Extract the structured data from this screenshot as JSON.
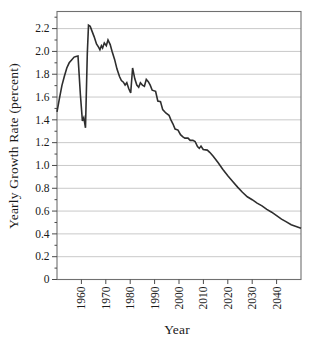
{
  "figure": {
    "background": "#ffffff",
    "frame_color": "#707070",
    "grid_color": "#c9c9c9",
    "tick_color": "#4a4a4a",
    "line_color": "#2e2e2e",
    "text_color": "#1a1a1a"
  },
  "chart_data": {
    "type": "line",
    "title": "",
    "xlabel": "Year",
    "ylabel": "Yearly Growth Rate (percent)",
    "xlim": [
      1950,
      2050
    ],
    "ylim": [
      0,
      2.35
    ],
    "grid": "horizontal-major",
    "legend": "none",
    "x_ticks": [
      1960,
      1970,
      1980,
      1990,
      2000,
      2010,
      2020,
      2030,
      2040
    ],
    "y_ticks": [
      {
        "value": 0.0,
        "label": "0"
      },
      {
        "value": 0.2,
        "label": "0.2"
      },
      {
        "value": 0.4,
        "label": "0.4"
      },
      {
        "value": 0.6,
        "label": "0.6"
      },
      {
        "value": 0.8,
        "label": "0.8"
      },
      {
        "value": 1.0,
        "label": "1.0"
      },
      {
        "value": 1.2,
        "label": "1.2"
      },
      {
        "value": 1.4,
        "label": "1.4"
      },
      {
        "value": 1.6,
        "label": "1.6"
      },
      {
        "value": 1.8,
        "label": "1.8"
      },
      {
        "value": 2.0,
        "label": "2.0"
      },
      {
        "value": 2.2,
        "label": "2.2"
      }
    ],
    "y_minor_ticks": [
      0.1,
      0.3,
      0.5,
      0.7,
      0.9,
      1.1,
      1.3,
      1.5,
      1.7,
      1.9,
      2.1,
      2.3
    ],
    "series": [
      {
        "name": "World yearly population growth rate (observed and projected)",
        "points": [
          [
            1950,
            1.47
          ],
          [
            1951,
            1.585
          ],
          [
            1952,
            1.7
          ],
          [
            1953,
            1.78
          ],
          [
            1954,
            1.855
          ],
          [
            1955,
            1.9
          ],
          [
            1956,
            1.925
          ],
          [
            1957,
            1.95
          ],
          [
            1957.8,
            1.955
          ],
          [
            1958.6,
            1.96
          ],
          [
            1959.6,
            1.62
          ],
          [
            1960.4,
            1.39
          ],
          [
            1961,
            1.42
          ],
          [
            1961.7,
            1.33
          ],
          [
            1962.4,
            1.98
          ],
          [
            1962.9,
            2.23
          ],
          [
            1963.6,
            2.22
          ],
          [
            1964.3,
            2.18
          ],
          [
            1965.2,
            2.13
          ],
          [
            1966.2,
            2.065
          ],
          [
            1967.1,
            2.035
          ],
          [
            1967.6,
            2.015
          ],
          [
            1968.2,
            2.05
          ],
          [
            1968.7,
            2.03
          ],
          [
            1969.4,
            2.075
          ],
          [
            1970.2,
            2.05
          ],
          [
            1970.9,
            2.1
          ],
          [
            1971.8,
            2.06
          ],
          [
            1972.6,
            2.0
          ],
          [
            1973.6,
            1.93
          ],
          [
            1974.6,
            1.845
          ],
          [
            1975.6,
            1.78
          ],
          [
            1976.4,
            1.745
          ],
          [
            1977.2,
            1.73
          ],
          [
            1977.9,
            1.705
          ],
          [
            1978.6,
            1.725
          ],
          [
            1979.4,
            1.675
          ],
          [
            1980.2,
            1.635
          ],
          [
            1981.0,
            1.855
          ],
          [
            1981.9,
            1.76
          ],
          [
            1982.7,
            1.705
          ],
          [
            1983.5,
            1.685
          ],
          [
            1984.2,
            1.725
          ],
          [
            1985.0,
            1.705
          ],
          [
            1985.8,
            1.695
          ],
          [
            1986.6,
            1.755
          ],
          [
            1987.4,
            1.735
          ],
          [
            1988.2,
            1.705
          ],
          [
            1989.0,
            1.66
          ],
          [
            1990.4,
            1.65
          ],
          [
            1991.3,
            1.565
          ],
          [
            1992.4,
            1.56
          ],
          [
            1993.3,
            1.49
          ],
          [
            1994.6,
            1.46
          ],
          [
            1995.9,
            1.44
          ],
          [
            1996.7,
            1.4
          ],
          [
            1997.5,
            1.365
          ],
          [
            1998.4,
            1.32
          ],
          [
            1999.6,
            1.31
          ],
          [
            2000.6,
            1.27
          ],
          [
            2001.6,
            1.25
          ],
          [
            2002.4,
            1.24
          ],
          [
            2003.7,
            1.24
          ],
          [
            2004.6,
            1.22
          ],
          [
            2005.7,
            1.22
          ],
          [
            2006.6,
            1.21
          ],
          [
            2007.6,
            1.165
          ],
          [
            2008.3,
            1.15
          ],
          [
            2009.0,
            1.17
          ],
          [
            2009.9,
            1.14
          ],
          [
            2011.6,
            1.135
          ],
          [
            2012.6,
            1.115
          ],
          [
            2014,
            1.08
          ],
          [
            2016,
            1.025
          ],
          [
            2018,
            0.965
          ],
          [
            2020,
            0.91
          ],
          [
            2022,
            0.86
          ],
          [
            2024,
            0.81
          ],
          [
            2026,
            0.765
          ],
          [
            2028,
            0.725
          ],
          [
            2030,
            0.7
          ],
          [
            2032,
            0.67
          ],
          [
            2034,
            0.645
          ],
          [
            2036,
            0.615
          ],
          [
            2038,
            0.59
          ],
          [
            2040,
            0.56
          ],
          [
            2042,
            0.53
          ],
          [
            2044,
            0.505
          ],
          [
            2046,
            0.48
          ],
          [
            2048,
            0.465
          ],
          [
            2050,
            0.45
          ]
        ]
      }
    ]
  }
}
